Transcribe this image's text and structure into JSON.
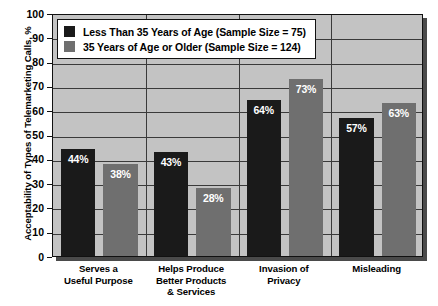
{
  "chart_data": {
    "type": "bar",
    "title": "",
    "xlabel": "",
    "ylabel": "Acceptability of Types of Telemarketing Calls, %",
    "ylim": [
      0,
      100
    ],
    "yticks": [
      0,
      10,
      20,
      30,
      40,
      50,
      60,
      70,
      80,
      90,
      100
    ],
    "grid": true,
    "legend_position": "top-left",
    "categories": [
      "Serves a\nUseful Purpose",
      "Helps Produce\nBetter Products\n& Services",
      "Invasion of\nPrivacy",
      "Misleading"
    ],
    "category_lines": [
      [
        "Serves a",
        "Useful Purpose"
      ],
      [
        "Helps Produce",
        "Better Products",
        "& Services"
      ],
      [
        "Invasion of",
        "Privacy"
      ],
      [
        "Misleading"
      ]
    ],
    "series": [
      {
        "name": "Less Than 35 Years of Age (Sample Size = 75)",
        "color": "#1a1a1a",
        "values": [
          44,
          43,
          64,
          57
        ],
        "value_labels": [
          "44%",
          "43%",
          "64%",
          "57%"
        ]
      },
      {
        "name": "35 Years of Age or Older (Sample Size = 124)",
        "color": "#6f6f6f",
        "values": [
          38,
          28,
          73,
          63
        ],
        "value_labels": [
          "38%",
          "28%",
          "73%",
          "63%"
        ]
      }
    ]
  },
  "axis": {
    "tick_labels": [
      "100",
      "90",
      "80",
      "70",
      "60",
      "50",
      "40",
      "30",
      "20",
      "10",
      "0"
    ],
    "y_title": "Acceptability of Types of Telemarketing Calls, %"
  },
  "legend": {
    "items": [
      {
        "label": "Less Than 35 Years of Age (Sample Size = 75)",
        "color": "#1a1a1a"
      },
      {
        "label": "35 Years of Age or Older (Sample Size = 124)",
        "color": "#6f6f6f"
      }
    ]
  },
  "colors": {
    "series_young": "#1a1a1a",
    "series_older": "#6f6f6f",
    "plot_background": "#c3c3c3",
    "grid": "#3a3a3a",
    "frame": "#111111",
    "value_label": "#ffffff"
  }
}
